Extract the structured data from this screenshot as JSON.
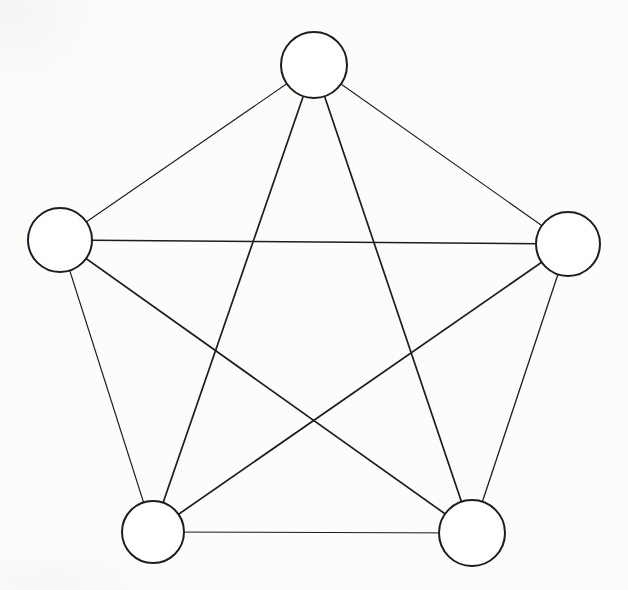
{
  "figure": {
    "width": 628,
    "height": 590,
    "background_color": "#fcfcfb",
    "stroke_color": "#1d1d1b",
    "node_fill_color": "#ffffff",
    "node_stroke_width": 2
  },
  "graph": {
    "nodes": [
      {
        "id": "top",
        "cx": 314,
        "cy": 65,
        "r": 33
      },
      {
        "id": "left",
        "cx": 60,
        "cy": 240,
        "r": 32
      },
      {
        "id": "right",
        "cx": 568,
        "cy": 244,
        "r": 32
      },
      {
        "id": "bottom-left",
        "cx": 153,
        "cy": 532,
        "r": 31
      },
      {
        "id": "bottom-right",
        "cx": 472,
        "cy": 533,
        "r": 33
      }
    ],
    "edges": [
      {
        "from": "top",
        "to": "left",
        "kind": "pentagon-side",
        "stroke_width": 1.1
      },
      {
        "from": "top",
        "to": "right",
        "kind": "pentagon-side",
        "stroke_width": 1.1
      },
      {
        "from": "left",
        "to": "bottom-left",
        "kind": "pentagon-side",
        "stroke_width": 1.2
      },
      {
        "from": "right",
        "to": "bottom-right",
        "kind": "pentagon-side",
        "stroke_width": 1.3
      },
      {
        "from": "bottom-left",
        "to": "bottom-right",
        "kind": "pentagon-side",
        "stroke_width": 1.1
      },
      {
        "from": "left",
        "to": "right",
        "kind": "star-diagonal",
        "stroke_width": 1.5
      },
      {
        "from": "top",
        "to": "bottom-left",
        "kind": "star-diagonal",
        "stroke_width": 1.7
      },
      {
        "from": "top",
        "to": "bottom-right",
        "kind": "star-diagonal",
        "stroke_width": 1.7
      },
      {
        "from": "left",
        "to": "bottom-right",
        "kind": "star-diagonal",
        "stroke_width": 1.7
      },
      {
        "from": "right",
        "to": "bottom-left",
        "kind": "star-diagonal",
        "stroke_width": 1.7
      }
    ]
  }
}
